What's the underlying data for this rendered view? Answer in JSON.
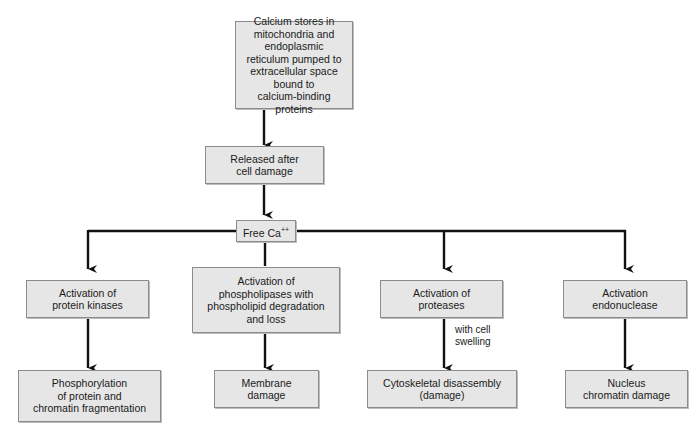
{
  "diagram": {
    "nodes": {
      "source": {
        "label": "Calcium stores in\nmitochondria and endoplasmic\nreticulum pumped to\nextracellular space bound to\ncalcium-binding proteins"
      },
      "released": {
        "label": "Released after\ncell damage"
      },
      "free_ca": {
        "label": "Free Ca",
        "superscript": "++"
      },
      "kinases": {
        "label": "Activation of\nprotein kinases"
      },
      "phospholipases": {
        "label": "Activation of\nphospholipases with\nphospholipid degradation\nand loss"
      },
      "proteases": {
        "label": "Activation of\nproteases"
      },
      "endonuclease": {
        "label": "Activation\nendonuclease"
      },
      "phosphorylation": {
        "label": "Phosphorylation\nof protein and\nchromatin fragmentation"
      },
      "membrane": {
        "label": "Membrane\ndamage"
      },
      "cytoskeletal": {
        "label": "Cytoskeletal disassembly\n(damage)"
      },
      "nucleus": {
        "label": "Nucleus\nchromatin damage"
      }
    },
    "edge_notes": {
      "proteases_to_cytoskeletal": "with cell\nswelling"
    },
    "edges": [
      [
        "source",
        "released"
      ],
      [
        "released",
        "free_ca"
      ],
      [
        "free_ca",
        "kinases"
      ],
      [
        "free_ca",
        "phospholipases"
      ],
      [
        "free_ca",
        "proteases"
      ],
      [
        "free_ca",
        "endonuclease"
      ],
      [
        "kinases",
        "phosphorylation"
      ],
      [
        "phospholipases",
        "membrane"
      ],
      [
        "proteases",
        "cytoskeletal"
      ],
      [
        "endonuclease",
        "nucleus"
      ]
    ],
    "colors": {
      "box_fill": "#e6e6e6",
      "box_border": "#8c8c8c",
      "line": "#111111"
    }
  }
}
